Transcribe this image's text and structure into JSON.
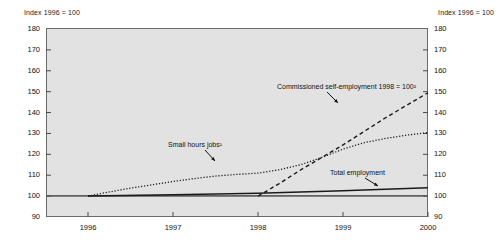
{
  "header": {
    "left_label": "Index 1996 = 100",
    "right_label": "Index 1996 = 100"
  },
  "annotations": {
    "small_hours": "Small hours jobs¹",
    "commissioned": "Commissioned self-employment 1998 = 100²",
    "total_employment": "Total employment"
  },
  "chart_data": {
    "type": "line",
    "title": "",
    "subtitle": "",
    "xlabel": "",
    "ylabel": "Index 1996 = 100",
    "ylim": [
      90,
      180
    ],
    "ytick_labels": [
      "180",
      "170",
      "160",
      "150",
      "140",
      "130",
      "120",
      "110",
      "100",
      "90"
    ],
    "yticks": [
      180,
      170,
      160,
      150,
      140,
      130,
      120,
      110,
      100,
      90
    ],
    "xlim": [
      1996,
      2000.6
    ],
    "categories": [
      "1996",
      "1997",
      "1998",
      "1999",
      "2000"
    ],
    "xtick_labels": [
      "1996",
      "1997",
      "1998",
      "1999",
      "2000"
    ],
    "grid": false,
    "legend_position": "inline-annotations",
    "reference_line": 100,
    "series": [
      {
        "name": "Small hours jobs¹",
        "style": "dotted",
        "color": "#1a1a1a",
        "x": [
          1996.0,
          1996.25,
          1996.5,
          1996.75,
          1997.0,
          1997.25,
          1997.5,
          1997.75,
          1998.0,
          1998.25,
          1998.5,
          1998.75,
          1999.0,
          1999.25,
          1999.5,
          1999.75,
          2000.0
        ],
        "y": [
          100.0,
          102.0,
          103.8,
          105.4,
          107.0,
          108.4,
          109.6,
          110.4,
          111.0,
          112.6,
          115.0,
          118.5,
          122.5,
          125.6,
          127.6,
          129.2,
          130.4
        ]
      },
      {
        "name": "Commissioned self-employment 1998 = 100²",
        "style": "dashed",
        "color": "#1a1a1a",
        "x": [
          1998.0,
          1998.25,
          1998.5,
          1998.75,
          1999.0,
          1999.25,
          1999.5,
          1999.75,
          2000.0
        ],
        "y": [
          100.0,
          106.0,
          112.5,
          118.5,
          124.5,
          131.0,
          137.5,
          143.5,
          149.5
        ]
      },
      {
        "name": "Total employment",
        "style": "solid",
        "color": "#1a1a1a",
        "x": [
          1996.0,
          1997.0,
          1998.0,
          1999.0,
          2000.0
        ],
        "y": [
          100.0,
          100.7,
          101.4,
          102.6,
          104.0
        ]
      }
    ]
  }
}
